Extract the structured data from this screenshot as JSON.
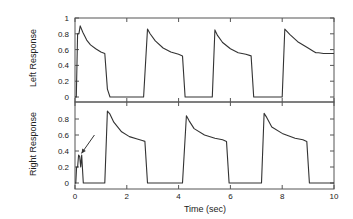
{
  "chart_data": [
    {
      "type": "line",
      "panel": "top",
      "ylabel": "Left Response",
      "xlabel": "",
      "xlim": [
        0,
        10
      ],
      "ylim": [
        0,
        1
      ],
      "yticks": [
        0,
        0.2,
        0.4,
        0.6,
        0.8,
        1
      ],
      "ytick_labels": [
        "0",
        "0.2",
        "0.4",
        "0.6",
        "0.8",
        "1"
      ],
      "xticks": [
        0,
        2,
        4,
        6,
        8,
        10
      ],
      "grid": false,
      "series": [
        {
          "name": "Left Response",
          "x": [
            0,
            0.05,
            0.1,
            0.15,
            0.2,
            0.3,
            0.45,
            0.6,
            0.8,
            1.0,
            1.15,
            1.25,
            1.35,
            1.5,
            2.0,
            2.5,
            2.65,
            2.8,
            2.9,
            3.1,
            3.4,
            3.7,
            4.0,
            4.15,
            4.25,
            4.35,
            4.6,
            5.0,
            5.3,
            5.4,
            5.5,
            5.7,
            6.0,
            6.3,
            6.6,
            6.8,
            6.9,
            7.0,
            7.2,
            7.5,
            7.9,
            8.0,
            8.1,
            8.3,
            8.6,
            9.0,
            9.2,
            9.3,
            9.4,
            9.6,
            10.0
          ],
          "y": [
            0,
            0.0,
            0.8,
            0.8,
            0.9,
            0.82,
            0.72,
            0.66,
            0.61,
            0.57,
            0.55,
            0.1,
            0.0,
            0.0,
            0.0,
            0.0,
            0.0,
            0.86,
            0.8,
            0.71,
            0.62,
            0.57,
            0.54,
            0.52,
            0.0,
            0.0,
            0.0,
            0.0,
            0.0,
            0.85,
            0.78,
            0.69,
            0.61,
            0.56,
            0.54,
            0.52,
            0.0,
            0.0,
            0.0,
            0.0,
            0.0,
            0.0,
            0.86,
            0.79,
            0.7,
            0.62,
            0.58,
            0.56,
            0.56,
            0.55,
            0.55
          ]
        }
      ]
    },
    {
      "type": "line",
      "panel": "bottom",
      "ylabel": "Right Response",
      "xlabel": "Time (sec)",
      "xlim": [
        0,
        10
      ],
      "ylim": [
        -0.08,
        1
      ],
      "yticks": [
        0,
        0.2,
        0.4,
        0.6,
        0.8
      ],
      "ytick_labels": [
        "0",
        "0.2",
        "0.4",
        "0.6",
        "0.8"
      ],
      "xticks": [
        0,
        2,
        4,
        6,
        8,
        10
      ],
      "xtick_labels": [
        "0",
        "2",
        "4",
        "6",
        "8",
        "10"
      ],
      "grid": false,
      "annotations": [
        {
          "type": "arrow",
          "text": "",
          "from": [
            0.75,
            0.6
          ],
          "to": [
            0.25,
            0.37
          ]
        }
      ],
      "series": [
        {
          "name": "Right Response",
          "x": [
            0,
            0.03,
            0.06,
            0.1,
            0.14,
            0.18,
            0.22,
            0.26,
            0.32,
            0.5,
            1.0,
            1.15,
            1.25,
            1.35,
            1.5,
            1.8,
            2.1,
            2.4,
            2.6,
            2.7,
            2.8,
            3.2,
            4.0,
            4.15,
            4.3,
            4.4,
            4.6,
            5.0,
            5.4,
            5.7,
            5.85,
            5.95,
            6.4,
            7.0,
            7.2,
            7.3,
            7.4,
            7.6,
            8.0,
            8.5,
            8.8,
            8.95,
            9.05,
            9.5,
            10.0
          ],
          "y": [
            0,
            0.0,
            0.2,
            0.2,
            0.35,
            0.33,
            0.2,
            0.35,
            0.0,
            0.0,
            0.0,
            0.0,
            0.9,
            0.86,
            0.76,
            0.64,
            0.58,
            0.55,
            0.53,
            0.52,
            0.0,
            0.0,
            0.0,
            0.0,
            0.84,
            0.78,
            0.68,
            0.6,
            0.56,
            0.54,
            0.52,
            0.0,
            0.0,
            0.0,
            0.0,
            0.87,
            0.82,
            0.7,
            0.62,
            0.56,
            0.54,
            0.52,
            0.0,
            0.0,
            0.0
          ]
        }
      ]
    }
  ],
  "labels": {
    "top_ylabel": "Left Response",
    "bottom_ylabel": "Right Response",
    "xlabel": "Time (sec)"
  },
  "colors": {
    "line": "#333333",
    "axis": "#555555",
    "text": "#222222"
  }
}
